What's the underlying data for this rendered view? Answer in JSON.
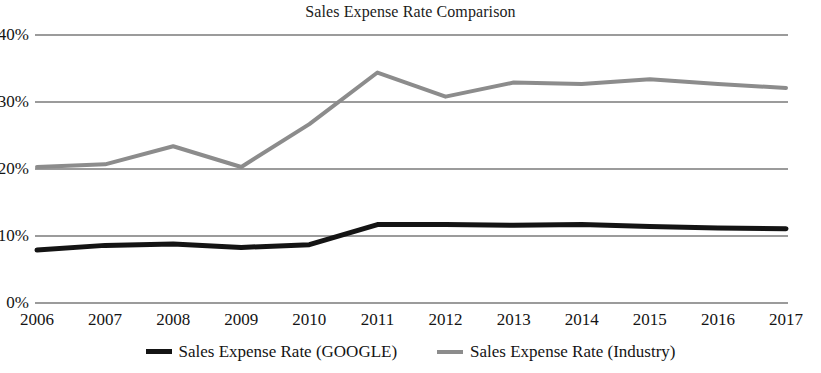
{
  "chart_data": {
    "type": "line",
    "title": "Sales Expense Rate Comparison",
    "xlabel": "",
    "ylabel": "",
    "categories": [
      "2006",
      "2007",
      "2008",
      "2009",
      "2010",
      "2011",
      "2012",
      "2013",
      "2014",
      "2015",
      "2016",
      "2017"
    ],
    "x": [
      2006,
      2007,
      2008,
      2009,
      2010,
      2011,
      2012,
      2013,
      2014,
      2015,
      2016,
      2017
    ],
    "ylim": [
      0,
      40
    ],
    "yticks": [
      0,
      10,
      20,
      30,
      40
    ],
    "ytick_labels": [
      "0%",
      "10%",
      "20%",
      "30%",
      "40%"
    ],
    "grid": true,
    "legend_position": "bottom",
    "series": [
      {
        "name": "Sales Expense Rate (GOOGLE)",
        "color": "#141414",
        "width": 5,
        "values": [
          7.9,
          8.6,
          8.8,
          8.3,
          8.7,
          11.7,
          11.7,
          11.6,
          11.7,
          11.4,
          11.2,
          11.1
        ]
      },
      {
        "name": "Sales Expense Rate (Industry)",
        "color": "#8c8c8c",
        "width": 4,
        "values": [
          20.3,
          20.7,
          23.4,
          20.3,
          26.7,
          34.4,
          30.8,
          32.9,
          32.7,
          33.4,
          32.7,
          32.1
        ]
      }
    ]
  },
  "axis": {
    "ytick_labels": [
      "40%",
      "30%",
      "20%",
      "10%",
      "0%"
    ],
    "xtick_labels": [
      "2006",
      "2007",
      "2008",
      "2009",
      "2010",
      "2011",
      "2012",
      "2013",
      "2014",
      "2015",
      "2016",
      "2017"
    ]
  },
  "legend": {
    "items": [
      {
        "label": "Sales Expense Rate (GOOGLE)",
        "color": "#141414"
      },
      {
        "label": "Sales Expense Rate (Industry)",
        "color": "#8c8c8c"
      }
    ]
  },
  "colors": {
    "google_line": "#141414",
    "industry_line": "#8c8c8c",
    "gridline": "#7a7a7a",
    "text": "#141414",
    "background": "#ffffff"
  }
}
